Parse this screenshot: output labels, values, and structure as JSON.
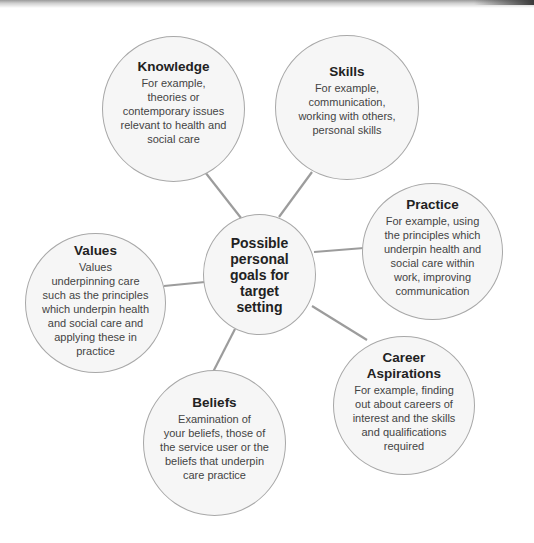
{
  "diagram": {
    "type": "mind-map",
    "center": {
      "lines": [
        "Possible",
        "personal",
        "goals for",
        "target",
        "setting"
      ]
    },
    "nodes": [
      {
        "id": "knowledge",
        "title_lines": [
          "Knowledge"
        ],
        "body_lines": [
          "For example,",
          "theories or",
          "contemporary issues",
          "relevant to health and",
          "social care"
        ]
      },
      {
        "id": "skills",
        "title_lines": [
          "Skills"
        ],
        "body_lines": [
          "For example,",
          "communication,",
          "working with others,",
          "personal skills"
        ]
      },
      {
        "id": "practice",
        "title_lines": [
          "Practice"
        ],
        "body_lines": [
          "For example, using",
          "the principles which",
          "underpin health and",
          "social care within",
          "work, improving",
          "communication"
        ]
      },
      {
        "id": "career-aspirations",
        "title_lines": [
          "Career",
          "Aspirations"
        ],
        "body_lines": [
          "For example, finding",
          "out about careers of",
          "interest and the skills",
          "and qualifications",
          "required"
        ]
      },
      {
        "id": "beliefs",
        "title_lines": [
          "Beliefs"
        ],
        "body_lines": [
          "Examination of",
          "your beliefs, those of",
          "the service user or the",
          "beliefs that underpin",
          "care practice"
        ]
      },
      {
        "id": "values",
        "title_lines": [
          "Values"
        ],
        "body_lines": [
          "Values",
          "underpinning care",
          "such as the principles",
          "which underpin health",
          "and social care and",
          "applying these in",
          "practice"
        ]
      }
    ]
  },
  "colors": {
    "circle_fill": "#f6f6f6",
    "circle_stroke": "#a8a8a8",
    "connector": "#9c9c9c",
    "title_text": "#222222",
    "body_text": "#444444"
  }
}
